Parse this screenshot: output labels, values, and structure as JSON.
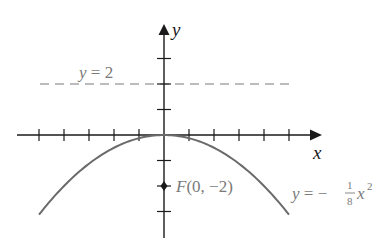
{
  "diagram": {
    "axes": {
      "x_label": "x",
      "y_label": "y",
      "origin_px": [
        164,
        135
      ],
      "unit_px": {
        "x": 25,
        "y": 25.5
      },
      "x_ticks": [
        -5,
        -4,
        -3,
        -2,
        -1,
        1,
        2,
        3,
        4,
        5
      ],
      "y_ticks": [
        3,
        2,
        1,
        -1,
        -2,
        -3
      ],
      "color": "#1a1a1a"
    },
    "directrix": {
      "label": "y = 2",
      "label_var": "y",
      "label_rest": " = 2",
      "y": 2,
      "style": "dashed",
      "color": "#7a7a7a"
    },
    "focus": {
      "label": "F(0, −2)",
      "label_var": "F",
      "label_rest": "(0, −2)",
      "x": 0,
      "y": -2
    },
    "parabola": {
      "equation": "y = −(1/8)x²",
      "eq_var": "y",
      "eq_eq": " = −",
      "frac_num": "1",
      "frac_den": "8",
      "eq_x": "x",
      "eq_exp": "2",
      "coefficient": -0.125,
      "x_range": [
        -5,
        5
      ],
      "color": "#6a6a6a"
    }
  }
}
